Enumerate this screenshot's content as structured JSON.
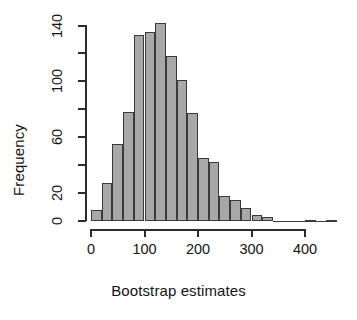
{
  "chart_data": {
    "type": "bar",
    "subtype": "histogram",
    "title": "",
    "xlabel": "Bootstrap estimates",
    "ylabel": "Frequency",
    "xlim": [
      0,
      460
    ],
    "ylim": [
      0,
      145
    ],
    "grid": false,
    "legend": null,
    "bin_width": 20,
    "bar_fill_color": "#a8a8a8",
    "bar_border_color": "#3a3a3a",
    "axis_color": "#2b2b2b",
    "bin_starts": [
      0,
      20,
      40,
      60,
      80,
      100,
      120,
      140,
      160,
      180,
      200,
      220,
      240,
      260,
      280,
      300,
      320,
      340,
      360,
      380,
      400,
      420,
      440
    ],
    "bin_ends": [
      20,
      40,
      60,
      80,
      100,
      120,
      140,
      160,
      180,
      200,
      220,
      240,
      260,
      280,
      300,
      320,
      340,
      360,
      380,
      400,
      420,
      440,
      460
    ],
    "categories": [
      "0-20",
      "20-40",
      "40-60",
      "60-80",
      "80-100",
      "100-120",
      "120-140",
      "140-160",
      "160-180",
      "180-200",
      "200-220",
      "220-240",
      "240-260",
      "260-280",
      "280-300",
      "300-320",
      "320-340",
      "340-360",
      "360-380",
      "380-400",
      "400-420",
      "420-440",
      "440-460"
    ],
    "values": [
      8,
      27,
      55,
      78,
      133,
      135,
      142,
      118,
      101,
      77,
      45,
      42,
      18,
      15,
      9,
      4,
      3,
      0,
      0,
      0,
      1,
      0,
      1
    ],
    "xticks": [
      0,
      100,
      200,
      300,
      400
    ],
    "xtick_labels": [
      "0",
      "100",
      "200",
      "300",
      "400"
    ],
    "yticks": [
      0,
      20,
      40,
      60,
      80,
      100,
      120,
      140
    ],
    "ytick_labels": [
      "0",
      "20",
      "",
      "60",
      "",
      "100",
      "",
      "140"
    ]
  }
}
